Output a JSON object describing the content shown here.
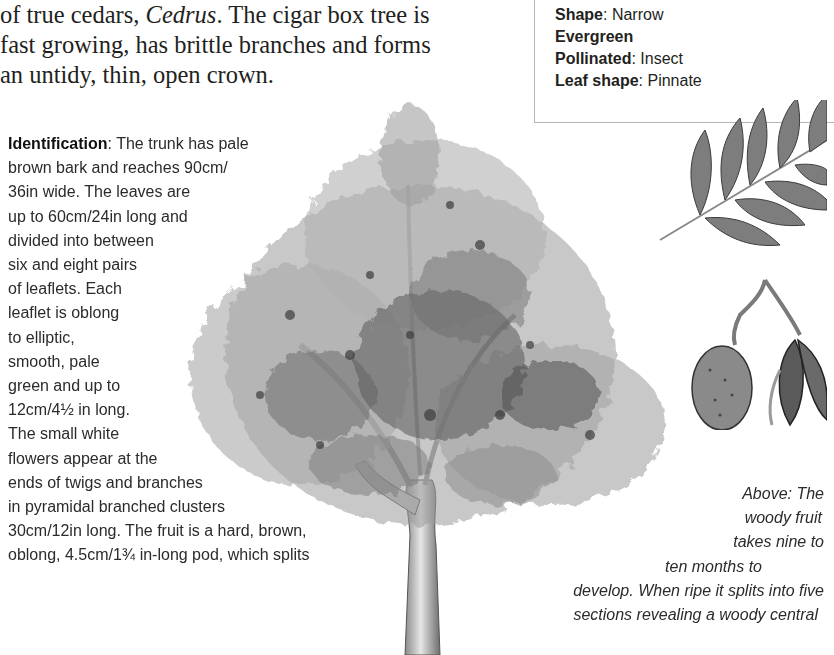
{
  "intro": {
    "lines": [
      {
        "before": "of true cedars, ",
        "italic": "Cedrus",
        "after": ". The cigar box tree is"
      },
      {
        "text": "fast growing, has brittle branches and forms"
      },
      {
        "text": "an untidy, thin, open crown."
      }
    ]
  },
  "factbox": {
    "facts": [
      {
        "label": "Shape",
        "sep": ": ",
        "value": "Narrow"
      },
      {
        "label": "Evergreen",
        "sep": "",
        "value": ""
      },
      {
        "label": "Pollinated",
        "sep": ": ",
        "value": "Insect"
      },
      {
        "label": "Leaf shape",
        "sep": ": ",
        "value": "Pinnate"
      }
    ]
  },
  "identification": {
    "label": "Identification",
    "first_line_rest": ": The trunk has pale",
    "lines": [
      "brown bark and reaches 90cm/",
      "36in wide. The leaves are",
      "up to 60cm/24in long and",
      "divided into between",
      "six and eight pairs",
      "of leaflets. Each",
      "leaflet is oblong",
      "to elliptic,",
      "smooth, pale",
      "green and up to",
      "12cm/4½ in long.",
      "The small white",
      "flowers appear at the",
      "ends of twigs and branches",
      "in pyramidal branched clusters",
      "30cm/12in long. The fruit is a hard, brown,",
      "oblong, 4.5cm/1¾ in-long pod, which splits"
    ]
  },
  "caption": {
    "lines": [
      "Above: The",
      "woody fruit",
      "takes nine to",
      "ten months to",
      "develop. When ripe it splits into five",
      "sections revealing a woody central"
    ]
  },
  "illustrations": {
    "tree": "cigar-box-tree-illustration",
    "leaf": "pinnate-leaf-illustration",
    "fruit": "woody-fruit-pod-illustration"
  },
  "colors": {
    "text": "#231f20",
    "box_border": "#b5b5b5",
    "foliage_dark": "#3c3c3c",
    "foliage_mid": "#7a7a7a",
    "foliage_light": "#b4b4b4"
  }
}
